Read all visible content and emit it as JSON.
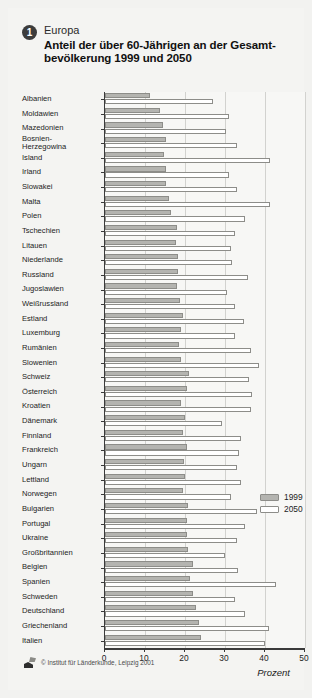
{
  "header": {
    "badge": "1",
    "region": "Europa",
    "title_line1": "Anteil der über 60-Jährigen an der Gesamt-",
    "title_line2": "bevölkerung 1999 und 2050"
  },
  "legend": {
    "items": [
      {
        "label": "1999",
        "color": "#b4b4b0"
      },
      {
        "label": "2050",
        "color": "#ffffff"
      }
    ]
  },
  "footer": {
    "copyright": "© Institut für Länderkunde, Leipzig 2001",
    "logo_icon": "map-logo-icon"
  },
  "axis": {
    "unit": "Prozent",
    "ticks": [
      "0",
      "10",
      "20",
      "30",
      "40",
      "50"
    ]
  },
  "chart_data": {
    "type": "bar",
    "orientation": "horizontal",
    "subtitle": "Europa",
    "xlabel": "Prozent",
    "ylabel": "",
    "xlim": [
      0,
      50
    ],
    "xticks": [
      0,
      10,
      20,
      30,
      40,
      50
    ],
    "grid": true,
    "legend_position": "middle-right",
    "categories": [
      "Albanien",
      "Moldawien",
      "Mazedonien",
      "Bosnien-\nHerzegowina",
      "Island",
      "Irland",
      "Slowakei",
      "Malta",
      "Polen",
      "Tschechien",
      "Litauen",
      "Niederlande",
      "Russland",
      "Jugoslawien",
      "Weißrussland",
      "Estland",
      "Luxemburg",
      "Rumänien",
      "Slowenien",
      "Schweiz",
      "Österreich",
      "Kroatien",
      "Dänemark",
      "Finnland",
      "Frankreich",
      "Ungarn",
      "Lettland",
      "Norwegen",
      "Bulgarien",
      "Portugal",
      "Ukraine",
      "Großbritannien",
      "Belgien",
      "Spanien",
      "Schweden",
      "Deutschland",
      "Griechenland",
      "Italien"
    ],
    "series": [
      {
        "name": "1999",
        "values": [
          11.3,
          13.7,
          14.5,
          15.3,
          14.7,
          15.2,
          15.3,
          16.1,
          16.5,
          18.1,
          17.8,
          18.3,
          18.2,
          17.9,
          18.8,
          19.6,
          19.1,
          18.4,
          18.9,
          20.9,
          20.4,
          19.0,
          19.9,
          19.4,
          20.5,
          19.7,
          20.1,
          19.6,
          20.8,
          20.4,
          20.6,
          20.7,
          22.0,
          21.3,
          22.0,
          22.7,
          23.5,
          24.0
        ]
      },
      {
        "name": "2050",
        "values": [
          27.0,
          31.0,
          30.3,
          33.0,
          41.3,
          31.0,
          33.1,
          41.2,
          34.9,
          32.6,
          31.6,
          31.7,
          35.8,
          30.4,
          32.5,
          34.7,
          32.4,
          36.5,
          38.4,
          35.9,
          36.7,
          36.5,
          29.2,
          34.0,
          33.4,
          33.0,
          33.9,
          31.4,
          38.0,
          35.1,
          32.9,
          30.0,
          33.2,
          42.8,
          32.6,
          35.1,
          40.9,
          40.0
        ]
      }
    ]
  }
}
